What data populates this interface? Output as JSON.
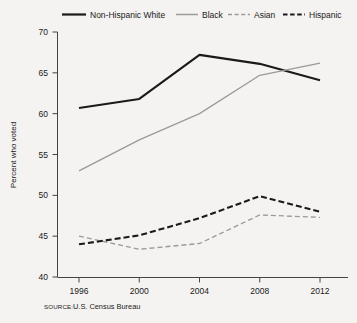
{
  "chart_data": {
    "type": "line",
    "title": "",
    "subtitle": "",
    "xlabel": "",
    "ylabel": "Percent who voted",
    "x": [
      1996,
      2000,
      2004,
      2008,
      2012
    ],
    "categories": [
      "1996",
      "2000",
      "2004",
      "2008",
      "2012"
    ],
    "xlim": [
      1996,
      2012
    ],
    "ylim": [
      40,
      70
    ],
    "yticks": [
      40,
      45,
      50,
      55,
      60,
      65,
      70
    ],
    "ytick_labels": [
      "40",
      "45",
      "50",
      "55",
      "60",
      "65",
      "70"
    ],
    "xticks": [
      1996,
      2000,
      2004,
      2008,
      2012
    ],
    "xtick_labels": [
      "1996",
      "2000",
      "2004",
      "2008",
      "2012"
    ],
    "grid": false,
    "legend_position": "top",
    "series": [
      {
        "name": "Non-Hispanic White",
        "values": [
          60.7,
          61.8,
          67.2,
          66.1,
          64.1
        ],
        "color": "#1a1a1a",
        "style": "solid",
        "width": 2.1
      },
      {
        "name": "Black",
        "values": [
          53.0,
          56.8,
          60.0,
          64.7,
          66.2
        ],
        "color": "#9a9a9a",
        "style": "solid",
        "width": 1.3
      },
      {
        "name": "Asian",
        "values": [
          45.0,
          43.4,
          44.1,
          47.6,
          47.3
        ],
        "color": "#9a9a9a",
        "style": "dashed",
        "width": 1.3
      },
      {
        "name": "Hispanic",
        "values": [
          44.0,
          45.1,
          47.2,
          49.9,
          48.0
        ],
        "color": "#1a1a1a",
        "style": "dashed",
        "width": 2.1
      }
    ]
  },
  "legend": {
    "entries": [
      {
        "label": "Non-Hispanic White"
      },
      {
        "label": "Black"
      },
      {
        "label": "Asian"
      },
      {
        "label": "Hispanic"
      }
    ]
  },
  "axis": {
    "y_title": "Percent who voted"
  },
  "source": {
    "prefix": "SOURCE:",
    "text": "U.S. Census Bureau"
  },
  "colors": {
    "background": "#f4f3f1",
    "dark": "#1a1a1a",
    "gray": "#9a9a9a",
    "axis": "#555555"
  }
}
